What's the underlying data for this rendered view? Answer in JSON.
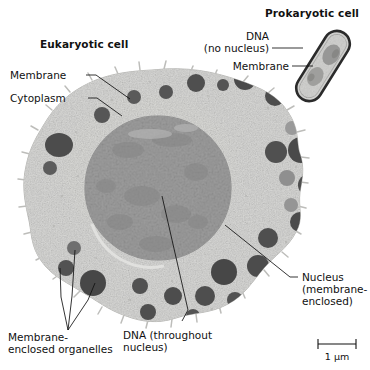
{
  "figure": {
    "kind": "cell-comparison-micrograph",
    "background_color": "#ffffff",
    "eukaryote_title": "Eukaryotic cell",
    "prokaryote_title": "Prokaryotic cell"
  },
  "labels": {
    "membrane": "Membrane",
    "cytoplasm": "Cytoplasm",
    "organelles_line1": "Membrane-",
    "organelles_line2": "enclosed organelles",
    "nucleus_line1": "Nucleus",
    "nucleus_line2": "(membrane-",
    "nucleus_line3": "enclosed)",
    "dna_euk_line1": "DNA (throughout",
    "dna_euk_line2": "nucleus)",
    "dna_pro_line1": "DNA",
    "dna_pro_line2": "(no nucleus)",
    "membrane_pro": "Membrane"
  },
  "scale_bar": {
    "label": "1 μm",
    "x1": 318,
    "x2": 356,
    "y": 344
  },
  "colors": {
    "cytoplasm": "#d8d8d6",
    "cytoplasm_edge": "#b9b9b7",
    "nucleus": "#9d9d9d",
    "nucleus_speckle": "#8a8a8a",
    "organelle_dark": "#4f4f4f",
    "organelle_mid": "#6f6f6f",
    "organelle_light": "#9a9a9a",
    "outline": "#111111",
    "prokaryote_wall": "#2b2b2b",
    "prokaryote_interior": "#cfcfcd",
    "prokaryote_dna": "#9b9b99",
    "text": "#111111"
  },
  "eukaryote": {
    "center": [
      152,
      196
    ],
    "radius": 126,
    "nucleus": {
      "cx": 158,
      "cy": 188,
      "rx": 73,
      "ry": 72
    },
    "organelles": [
      {
        "cx": 196,
        "cy": 83,
        "r": 9,
        "tone": "dark"
      },
      {
        "cx": 223,
        "cy": 85,
        "r": 6,
        "tone": "dark"
      },
      {
        "cx": 245,
        "cy": 79,
        "r": 11,
        "tone": "dark"
      },
      {
        "cx": 166,
        "cy": 92,
        "r": 7,
        "tone": "dark"
      },
      {
        "cx": 134,
        "cy": 97,
        "r": 7,
        "tone": "dark"
      },
      {
        "cx": 275,
        "cy": 96,
        "r": 10,
        "tone": "dark"
      },
      {
        "cx": 102,
        "cy": 115,
        "r": 8,
        "tone": "dark"
      },
      {
        "cx": 59,
        "cy": 145,
        "r": 13,
        "tone": "dark"
      },
      {
        "cx": 50,
        "cy": 168,
        "r": 7,
        "tone": "dark"
      },
      {
        "cx": 292,
        "cy": 128,
        "r": 7,
        "tone": "light"
      },
      {
        "cx": 301,
        "cy": 150,
        "r": 13,
        "tone": "dark"
      },
      {
        "cx": 276,
        "cy": 152,
        "r": 11,
        "tone": "dark"
      },
      {
        "cx": 287,
        "cy": 178,
        "r": 8,
        "tone": "light"
      },
      {
        "cx": 309,
        "cy": 185,
        "r": 11,
        "tone": "dark"
      },
      {
        "cx": 291,
        "cy": 205,
        "r": 7,
        "tone": "light"
      },
      {
        "cx": 300,
        "cy": 222,
        "r": 10,
        "tone": "dark"
      },
      {
        "cx": 268,
        "cy": 238,
        "r": 10,
        "tone": "dark"
      },
      {
        "cx": 258,
        "cy": 266,
        "r": 11,
        "tone": "dark"
      },
      {
        "cx": 224,
        "cy": 272,
        "r": 13,
        "tone": "dark"
      },
      {
        "cx": 205,
        "cy": 296,
        "r": 10,
        "tone": "dark"
      },
      {
        "cx": 235,
        "cy": 300,
        "r": 8,
        "tone": "dark"
      },
      {
        "cx": 173,
        "cy": 296,
        "r": 9,
        "tone": "dark"
      },
      {
        "cx": 140,
        "cy": 286,
        "r": 8,
        "tone": "dark"
      },
      {
        "cx": 93,
        "cy": 283,
        "r": 13,
        "tone": "dark"
      },
      {
        "cx": 66,
        "cy": 268,
        "r": 8,
        "tone": "dark"
      },
      {
        "cx": 74,
        "cy": 248,
        "r": 7,
        "tone": "mid"
      },
      {
        "cx": 148,
        "cy": 312,
        "r": 8,
        "tone": "dark"
      },
      {
        "cx": 193,
        "cy": 316,
        "r": 7,
        "tone": "dark"
      }
    ]
  },
  "prokaryote": {
    "center": [
      323,
      66
    ],
    "length": 78,
    "width": 26,
    "angle_deg": -58,
    "dna_patches": [
      {
        "cx": 316,
        "cy": 50,
        "r": 9
      },
      {
        "cx": 330,
        "cy": 78,
        "r": 10
      }
    ]
  },
  "leaders": {
    "membrane": [
      [
        86,
        75
      ],
      [
        96,
        75
      ],
      [
        130,
        99
      ]
    ],
    "cytoplasm": [
      [
        88,
        98
      ],
      [
        97,
        98
      ],
      [
        122,
        116
      ]
    ],
    "organelles": [
      [
        [
          68,
          330
        ],
        [
          61,
          297
        ],
        [
          60,
          268
        ]
      ],
      [
        [
          68,
          330
        ],
        [
          72,
          296
        ],
        [
          75,
          250
        ]
      ],
      [
        [
          68,
          330
        ],
        [
          88,
          300
        ],
        [
          95,
          283
        ]
      ]
    ],
    "nucleus": [
      [
        298,
        277
      ],
      [
        290,
        277
      ],
      [
        225,
        225
      ]
    ],
    "dna_euk": [
      [
        182,
        321
      ],
      [
        188,
        310
      ],
      [
        162,
        196
      ]
    ],
    "dna_pro": [
      [
        272,
        48
      ],
      [
        302,
        48
      ]
    ],
    "membrane_pro": [
      [
        292,
        66
      ],
      [
        312,
        66
      ]
    ]
  }
}
